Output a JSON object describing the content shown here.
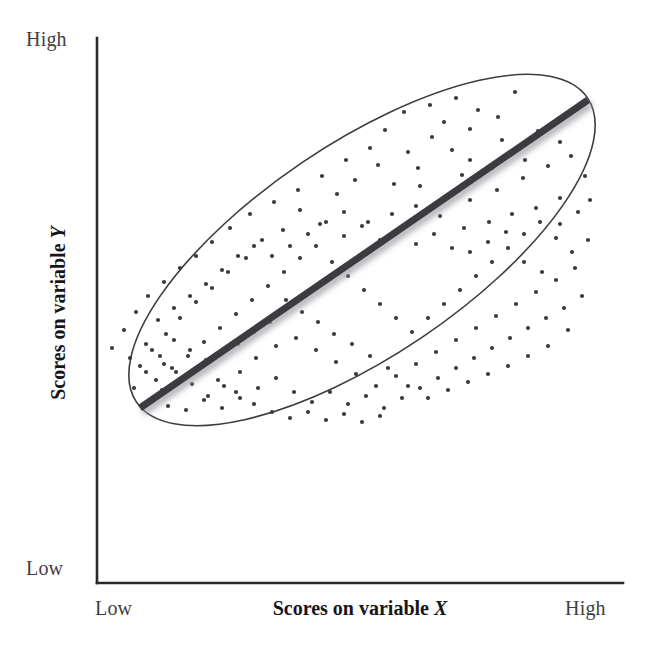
{
  "figure": {
    "kind": "scatterplot-with-regression-line",
    "background_color": "#ffffff"
  },
  "axes": {
    "y_axis": {
      "title_text": "Scores on variable",
      "title_variable": "Y",
      "high_label": "High",
      "low_label": "Low"
    },
    "x_axis": {
      "title_text": "Scores on variable",
      "title_variable": "X",
      "low_label": "Low",
      "high_label": "High"
    }
  },
  "colors": {
    "axis_line": "#2a2a2e",
    "point": "#3a3a3f",
    "ellipse_stroke": "#3c3c42",
    "regression_line": "#3a3a3f",
    "regression_shadow": "#b9b9bd",
    "label_text": "#3f3f44",
    "title_text": "#16161a"
  },
  "chart_data": {
    "type": "scatter",
    "title": "",
    "xlabel": "Scores on variable X",
    "ylabel": "Scores on variable Y",
    "xlim": [
      0,
      1
    ],
    "ylim": [
      0,
      1
    ],
    "xtick_labels": [
      "Low",
      "High"
    ],
    "ytick_labels": [
      "Low",
      "High"
    ],
    "grid": false,
    "legend": null,
    "relationship": "positive linear correlation",
    "n_points": 205,
    "point_radius_px": 2.1,
    "regression_line": {
      "x0_px": 140,
      "y0_px": 408,
      "x1_px": 588,
      "y1_px": 100,
      "width_px": 7,
      "has_drop_shadow": true
    },
    "ellipse": {
      "center_px": [
        362,
        250
      ],
      "semi_major_px": 272,
      "semi_minor_px": 106,
      "rotation_deg": -34,
      "stroke_width_px": 1.6,
      "filled": false
    },
    "plot_area_px": {
      "left": 97,
      "top": 38,
      "right": 623,
      "bottom": 583
    },
    "points": [
      [
        515,
        92
      ],
      [
        498,
        117
      ],
      [
        470,
        129
      ],
      [
        452,
        150
      ],
      [
        538,
        131
      ],
      [
        560,
        142
      ],
      [
        525,
        160
      ],
      [
        492,
        168
      ],
      [
        462,
        175
      ],
      [
        432,
        137
      ],
      [
        408,
        152
      ],
      [
        385,
        130
      ],
      [
        378,
        165
      ],
      [
        355,
        180
      ],
      [
        337,
        194
      ],
      [
        420,
        186
      ],
      [
        446,
        196
      ],
      [
        470,
        200
      ],
      [
        497,
        190
      ],
      [
        523,
        178
      ],
      [
        548,
        166
      ],
      [
        571,
        156
      ],
      [
        585,
        176
      ],
      [
        560,
        198
      ],
      [
        536,
        208
      ],
      [
        512,
        214
      ],
      [
        489,
        222
      ],
      [
        464,
        228
      ],
      [
        440,
        216
      ],
      [
        416,
        206
      ],
      [
        392,
        214
      ],
      [
        368,
        222
      ],
      [
        344,
        212
      ],
      [
        320,
        224
      ],
      [
        300,
        210
      ],
      [
        283,
        230
      ],
      [
        262,
        240
      ],
      [
        246,
        258
      ],
      [
        228,
        272
      ],
      [
        212,
        288
      ],
      [
        196,
        302
      ],
      [
        180,
        318
      ],
      [
        166,
        334
      ],
      [
        152,
        350
      ],
      [
        140,
        366
      ],
      [
        156,
        380
      ],
      [
        172,
        368
      ],
      [
        188,
        356
      ],
      [
        204,
        342
      ],
      [
        220,
        328
      ],
      [
        236,
        314
      ],
      [
        252,
        300
      ],
      [
        268,
        286
      ],
      [
        284,
        272
      ],
      [
        300,
        258
      ],
      [
        316,
        246
      ],
      [
        332,
        262
      ],
      [
        348,
        276
      ],
      [
        364,
        290
      ],
      [
        380,
        304
      ],
      [
        396,
        318
      ],
      [
        412,
        332
      ],
      [
        428,
        318
      ],
      [
        444,
        304
      ],
      [
        460,
        290
      ],
      [
        476,
        276
      ],
      [
        492,
        262
      ],
      [
        508,
        248
      ],
      [
        524,
        234
      ],
      [
        540,
        222
      ],
      [
        556,
        238
      ],
      [
        572,
        252
      ],
      [
        588,
        240
      ],
      [
        575,
        268
      ],
      [
        556,
        280
      ],
      [
        536,
        292
      ],
      [
        516,
        304
      ],
      [
        496,
        316
      ],
      [
        476,
        328
      ],
      [
        456,
        340
      ],
      [
        436,
        352
      ],
      [
        416,
        364
      ],
      [
        396,
        376
      ],
      [
        376,
        386
      ],
      [
        356,
        374
      ],
      [
        336,
        362
      ],
      [
        316,
        350
      ],
      [
        296,
        338
      ],
      [
        276,
        346
      ],
      [
        256,
        358
      ],
      [
        240,
        372
      ],
      [
        224,
        386
      ],
      [
        208,
        396
      ],
      [
        192,
        384
      ],
      [
        176,
        372
      ],
      [
        162,
        390
      ],
      [
        150,
        402
      ],
      [
        168,
        406
      ],
      [
        186,
        410
      ],
      [
        204,
        400
      ],
      [
        222,
        408
      ],
      [
        240,
        398
      ],
      [
        258,
        388
      ],
      [
        276,
        378
      ],
      [
        294,
        392
      ],
      [
        312,
        402
      ],
      [
        330,
        392
      ],
      [
        348,
        404
      ],
      [
        366,
        396
      ],
      [
        384,
        408
      ],
      [
        402,
        398
      ],
      [
        420,
        388
      ],
      [
        438,
        378
      ],
      [
        456,
        368
      ],
      [
        474,
        358
      ],
      [
        492,
        348
      ],
      [
        510,
        338
      ],
      [
        528,
        328
      ],
      [
        546,
        318
      ],
      [
        564,
        308
      ],
      [
        582,
        296
      ],
      [
        568,
        330
      ],
      [
        548,
        346
      ],
      [
        528,
        356
      ],
      [
        508,
        366
      ],
      [
        488,
        374
      ],
      [
        468,
        382
      ],
      [
        448,
        390
      ],
      [
        428,
        398
      ],
      [
        408,
        386
      ],
      [
        388,
        368
      ],
      [
        370,
        356
      ],
      [
        352,
        344
      ],
      [
        334,
        334
      ],
      [
        318,
        322
      ],
      [
        302,
        312
      ],
      [
        286,
        300
      ],
      [
        270,
        322
      ],
      [
        254,
        332
      ],
      [
        238,
        344
      ],
      [
        222,
        352
      ],
      [
        206,
        360
      ],
      [
        190,
        350
      ],
      [
        174,
        340
      ],
      [
        160,
        356
      ],
      [
        146,
        372
      ],
      [
        134,
        388
      ],
      [
        158,
        320
      ],
      [
        174,
        308
      ],
      [
        190,
        296
      ],
      [
        206,
        284
      ],
      [
        222,
        270
      ],
      [
        238,
        256
      ],
      [
        254,
        246
      ],
      [
        272,
        256
      ],
      [
        290,
        246
      ],
      [
        308,
        234
      ],
      [
        326,
        222
      ],
      [
        344,
        236
      ],
      [
        362,
        226
      ],
      [
        380,
        240
      ],
      [
        398,
        230
      ],
      [
        416,
        244
      ],
      [
        434,
        234
      ],
      [
        452,
        248
      ],
      [
        470,
        252
      ],
      [
        488,
        242
      ],
      [
        506,
        232
      ],
      [
        524,
        262
      ],
      [
        542,
        272
      ],
      [
        560,
        224
      ],
      [
        578,
        212
      ],
      [
        590,
        200
      ],
      [
        404,
        112
      ],
      [
        430,
        105
      ],
      [
        456,
        98
      ],
      [
        478,
        110
      ],
      [
        502,
        140
      ],
      [
        470,
        160
      ],
      [
        444,
        122
      ],
      [
        418,
        168
      ],
      [
        394,
        184
      ],
      [
        370,
        148
      ],
      [
        346,
        160
      ],
      [
        322,
        176
      ],
      [
        298,
        190
      ],
      [
        274,
        202
      ],
      [
        250,
        214
      ],
      [
        230,
        228
      ],
      [
        212,
        242
      ],
      [
        196,
        256
      ],
      [
        180,
        268
      ],
      [
        164,
        282
      ],
      [
        148,
        296
      ],
      [
        136,
        312
      ],
      [
        124,
        330
      ],
      [
        112,
        348
      ],
      [
        130,
        358
      ],
      [
        146,
        344
      ],
      [
        164,
        364
      ],
      [
        182,
        378
      ],
      [
        200,
        368
      ],
      [
        218,
        380
      ],
      [
        236,
        392
      ],
      [
        254,
        404
      ],
      [
        272,
        412
      ],
      [
        290,
        418
      ],
      [
        308,
        412
      ],
      [
        326,
        420
      ],
      [
        344,
        414
      ],
      [
        362,
        422
      ],
      [
        380,
        416
      ]
    ]
  }
}
